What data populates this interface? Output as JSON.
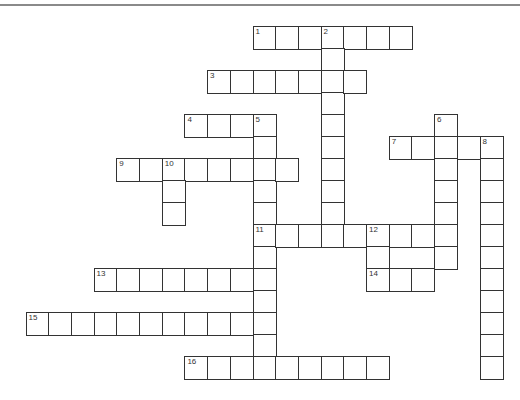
{
  "puzzle": {
    "grid_origin": {
      "x": 25.5,
      "y": 26
    },
    "cell_pitch": {
      "x": 22.7,
      "y": 22
    },
    "line_color": "#333333",
    "top_rule_color": "#8a8a8a",
    "entries": [
      {
        "number": "1",
        "direction": "across",
        "row": 0,
        "col": 10,
        "length": 7
      },
      {
        "number": "2",
        "direction": "down",
        "row": 0,
        "col": 13,
        "length": 10
      },
      {
        "number": "3",
        "direction": "across",
        "row": 2,
        "col": 8,
        "length": 7
      },
      {
        "number": "4",
        "direction": "across",
        "row": 4,
        "col": 7,
        "length": 4
      },
      {
        "number": "5",
        "direction": "down",
        "row": 4,
        "col": 10,
        "length": 12
      },
      {
        "number": "6",
        "direction": "down",
        "row": 4,
        "col": 18,
        "length": 7
      },
      {
        "number": "7",
        "direction": "across",
        "row": 5,
        "col": 16,
        "length": 5
      },
      {
        "number": "8",
        "direction": "down",
        "row": 5,
        "col": 20,
        "length": 11
      },
      {
        "number": "9",
        "direction": "across",
        "row": 6,
        "col": 4,
        "length": 8
      },
      {
        "number": "10",
        "direction": "down",
        "row": 6,
        "col": 6,
        "length": 3
      },
      {
        "number": "11",
        "direction": "across",
        "row": 9,
        "col": 10,
        "length": 9
      },
      {
        "number": "12",
        "direction": "down",
        "row": 9,
        "col": 15,
        "length": 3
      },
      {
        "number": "13",
        "direction": "across",
        "row": 11,
        "col": 3,
        "length": 8
      },
      {
        "number": "14",
        "direction": "across",
        "row": 11,
        "col": 15,
        "length": 3
      },
      {
        "number": "15",
        "direction": "across",
        "row": 13,
        "col": 0,
        "length": 11
      },
      {
        "number": "16",
        "direction": "across",
        "row": 15,
        "col": 7,
        "length": 9
      }
    ]
  }
}
